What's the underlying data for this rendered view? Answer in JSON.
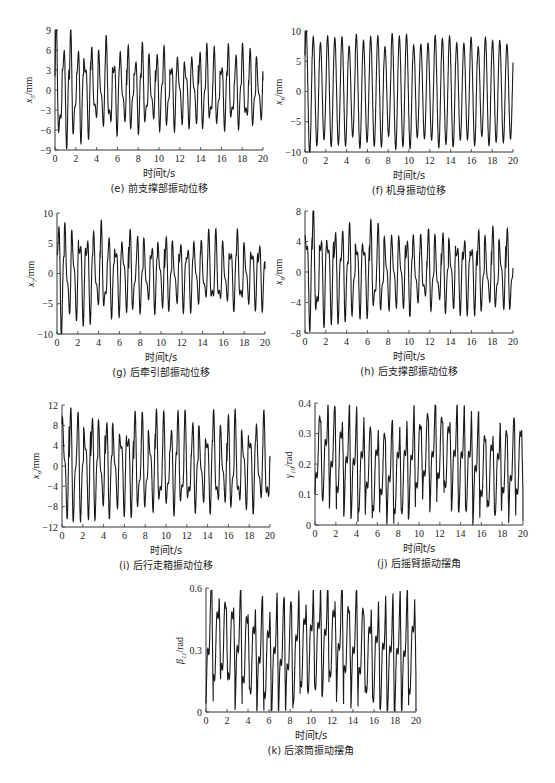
{
  "figure": {
    "panels": [
      {
        "id": "e",
        "caption": "(e) 前支撑部振动位移",
        "xlabel": "时间t/s",
        "ylabel_var": "x",
        "ylabel_sub": "5",
        "ylabel_unit": "/mm"
      },
      {
        "id": "f",
        "caption": "(f) 机身振动位移",
        "xlabel": "时间t/s",
        "ylabel_var": "x",
        "ylabel_sub": "6",
        "ylabel_unit": "/mm"
      },
      {
        "id": "g",
        "caption": "(g) 后牵引部振动位移",
        "xlabel": "时间t/s",
        "ylabel_var": "x",
        "ylabel_sub": "7",
        "ylabel_unit": "/mm"
      },
      {
        "id": "h",
        "caption": "(h) 后支撑部振动位移",
        "xlabel": "时间t/s",
        "ylabel_var": "x",
        "ylabel_sub": "8",
        "ylabel_unit": "/mm"
      },
      {
        "id": "i",
        "caption": "(i) 后行走箱振动位移",
        "xlabel": "时间t/s",
        "ylabel_var": "x",
        "ylabel_sub": "9",
        "ylabel_unit": "/mm"
      },
      {
        "id": "j",
        "caption": "(j) 后摇臂振动摆角",
        "xlabel": "时间t/s",
        "ylabel_var": "γ",
        "ylabel_sub": "10",
        "ylabel_unit": "/rad"
      },
      {
        "id": "k",
        "caption": "(k) 后滚筒振动摆角",
        "xlabel": "时间t/s",
        "ylabel_var": "β",
        "ylabel_sub": "11",
        "ylabel_unit": "/rad"
      }
    ]
  },
  "chart_data": [
    {
      "type": "line",
      "title": "(e) 前支撑部振动位移",
      "xlabel": "时间t/s",
      "ylabel": "x5/mm",
      "xlim": [
        0,
        20
      ],
      "ylim": [
        -9,
        9
      ],
      "xticks": [
        0,
        2,
        4,
        6,
        8,
        10,
        12,
        14,
        16,
        18,
        20
      ],
      "yticks": [
        -9,
        -6,
        -3,
        0,
        3,
        6,
        9
      ],
      "description": "Irregular multi-frequency oscillation; early peaks near ±8.5–9 mm decaying to about +5/-5 mm by 20 s",
      "gen": {
        "freq": 1.45,
        "f2": 2.9,
        "a2": 0.45,
        "amp_start": 8.6,
        "amp_end": 5.4,
        "offset": 0,
        "seed": 5
      }
    },
    {
      "type": "line",
      "title": "(f) 机身振动位移",
      "xlabel": "时间t/s",
      "ylabel": "x6/mm",
      "xlim": [
        0,
        20
      ],
      "ylim": [
        -10,
        10
      ],
      "xticks": [
        0,
        2,
        4,
        6,
        8,
        10,
        12,
        14,
        16,
        18,
        20
      ],
      "yticks": [
        -10,
        -5,
        0,
        5,
        10
      ],
      "description": "Regular sinusoid ~1.45 Hz; amplitude decays from ~10 mm to ~8.3 mm and stays steady",
      "gen": {
        "freq": 1.45,
        "f2": 0,
        "a2": 0,
        "amp_start": 9.9,
        "amp_end": 8.2,
        "offset": 0,
        "seed": 6
      }
    },
    {
      "type": "line",
      "title": "(g) 后牵引部振动位移",
      "xlabel": "时间t/s",
      "ylabel": "x7/mm",
      "xlim": [
        0,
        20
      ],
      "ylim": [
        -10,
        10
      ],
      "xticks": [
        0,
        2,
        4,
        6,
        8,
        10,
        12,
        14,
        16,
        18,
        20
      ],
      "yticks": [
        -10,
        -5,
        0,
        5,
        10
      ],
      "description": "Irregular oscillation; peaks ~±10 mm early, ~+6/-5 mm later",
      "gen": {
        "freq": 1.45,
        "f2": 2.9,
        "a2": 0.45,
        "amp_start": 9.6,
        "amp_end": 5.6,
        "offset": 0,
        "seed": 7
      }
    },
    {
      "type": "line",
      "title": "(h) 后支撑部振动位移",
      "xlabel": "时间t/s",
      "ylabel": "x8/mm",
      "xlim": [
        0,
        20
      ],
      "ylim": [
        -8,
        8
      ],
      "xticks": [
        0,
        2,
        4,
        6,
        8,
        10,
        12,
        14,
        16,
        18,
        20
      ],
      "yticks": [
        -8,
        -4,
        0,
        4,
        8
      ],
      "description": "Irregular oscillation; peak ~7.8 mm near t=0.3 s, settling to about ±5 mm",
      "gen": {
        "freq": 1.45,
        "f2": 2.9,
        "a2": 0.45,
        "amp_start": 7.4,
        "amp_end": 5.0,
        "offset": 0,
        "seed": 8
      }
    },
    {
      "type": "line",
      "title": "(i) 后行走箱振动位移",
      "xlabel": "时间t/s",
      "ylabel": "x9/mm",
      "xlim": [
        0,
        20
      ],
      "ylim": [
        -12,
        12
      ],
      "xticks": [
        0,
        2,
        4,
        6,
        8,
        10,
        12,
        14,
        16,
        18,
        20
      ],
      "yticks": [
        -12,
        -8,
        -4,
        0,
        4,
        8,
        12
      ],
      "description": "Irregular oscillation; peaks ~±11.5 mm early, about +8/-9 mm later",
      "gen": {
        "freq": 1.45,
        "f2": 2.9,
        "a2": 0.45,
        "amp_start": 11.3,
        "amp_end": 8.5,
        "offset": 0,
        "seed": 9
      }
    },
    {
      "type": "line",
      "title": "(j) 后摇臂振动摆角",
      "xlabel": "时间t/s",
      "ylabel": "γ10/rad",
      "xlim": [
        0,
        20
      ],
      "ylim": [
        0,
        0.4
      ],
      "xticks": [
        0,
        2,
        4,
        6,
        8,
        10,
        12,
        14,
        16,
        18,
        20
      ],
      "yticks": [
        0,
        0.1,
        0.2,
        0.3,
        0.4
      ],
      "description": "Sawtooth-like oscillation between ~0.05 and ~0.35 rad; dip around 7–9 s (0.02–0.31), rise to ~0.38 near 17 s",
      "gen": {
        "freq": 1.45,
        "f2": 2.9,
        "a2": 0.3,
        "amp_start": 0.15,
        "amp_end": 0.15,
        "offset": 0.205,
        "seed": 10,
        "wobble": 0.03
      }
    },
    {
      "type": "line",
      "title": "(k) 后滚筒振动摆角",
      "xlabel": "时间t/s",
      "ylabel": "β11/rad",
      "xlim": [
        0,
        20
      ],
      "ylim": [
        0,
        0.6
      ],
      "xticks": [
        0,
        2,
        4,
        6,
        8,
        10,
        12,
        14,
        16,
        18,
        20
      ],
      "yticks": [
        0,
        0.3,
        0.6
      ],
      "description": "Sawtooth-like oscillation between ~0.05 and ~0.57 rad; slight drop around 13–15 s, peak ~0.59 near 17–17.5 s",
      "gen": {
        "freq": 1.45,
        "f2": 2.9,
        "a2": 0.3,
        "amp_start": 0.25,
        "amp_end": 0.24,
        "offset": 0.31,
        "seed": 11,
        "wobble": 0.04
      }
    }
  ]
}
